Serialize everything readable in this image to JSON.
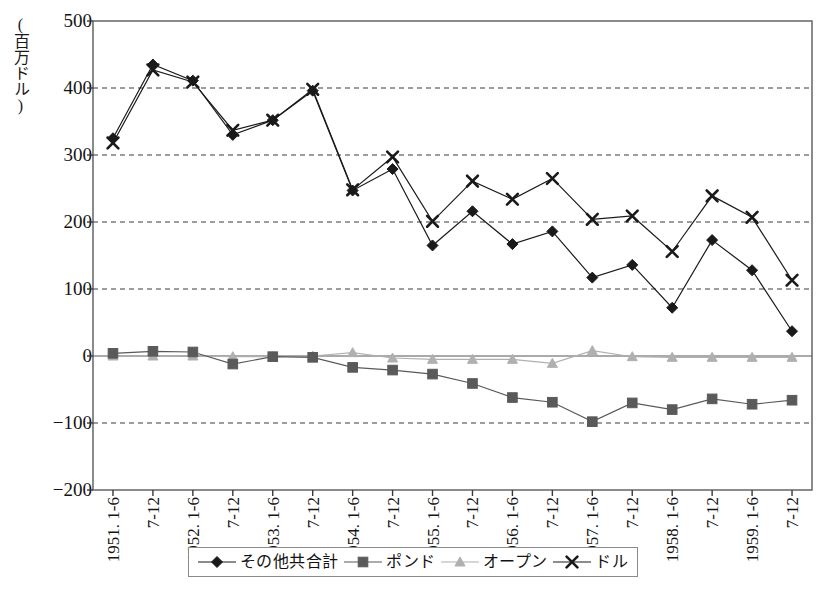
{
  "chart_data": {
    "type": "line",
    "title": "",
    "xlabel": "",
    "ylabel": "(百万ドル)",
    "ylim": [
      -200,
      500
    ],
    "ytick_values": [
      500,
      400,
      300,
      200,
      100,
      0,
      -100,
      -200
    ],
    "ytick_labels": [
      "500",
      "400",
      "300",
      "200",
      "100",
      "0",
      "−100",
      "−200"
    ],
    "grid": "horizontal-dashed",
    "legend_position": "bottom",
    "categories": [
      "1951. 1-6",
      "7-12",
      "1952. 1-6",
      "7-12",
      "1953. 1-6",
      "7-12",
      "1954. 1-6",
      "7-12",
      "1955. 1-6",
      "7-12",
      "1956. 1-6",
      "7-12",
      "1957. 1-6",
      "7-12",
      "1958. 1-6",
      "7-12",
      "1959. 1-6",
      "7-12"
    ],
    "series": [
      {
        "name": "その他共合計",
        "marker": "diamond",
        "color": "#1a1a1a",
        "values": [
          325,
          435,
          411,
          330,
          352,
          396,
          247,
          279,
          165,
          216,
          167,
          186,
          117,
          136,
          72,
          173,
          128,
          37
        ]
      },
      {
        "name": "ポンド",
        "marker": "square",
        "color": "#5a5a5a",
        "values": [
          4,
          7,
          6,
          -12,
          -1,
          -2,
          -17,
          -21,
          -27,
          -41,
          -62,
          -69,
          -98,
          -70,
          -80,
          -64,
          -72,
          -66
        ]
      },
      {
        "name": "オープン",
        "marker": "triangle",
        "color": "#b0b0b0",
        "values": [
          0,
          0,
          0,
          -1,
          -1,
          0,
          5,
          -3,
          -5,
          -5,
          -5,
          -11,
          8,
          -1,
          -2,
          -2,
          -2,
          -2
        ]
      },
      {
        "name": "ドル",
        "marker": "x",
        "color": "#1a1a1a",
        "values": [
          318,
          427,
          409,
          337,
          352,
          398,
          248,
          297,
          201,
          261,
          234,
          265,
          204,
          209,
          156,
          239,
          207,
          113
        ]
      }
    ]
  },
  "legend": {
    "items": [
      {
        "label": "その他共合計",
        "marker": "diamond"
      },
      {
        "label": "ポンド",
        "marker": "square"
      },
      {
        "label": "オープン",
        "marker": "triangle"
      },
      {
        "label": "ドル",
        "marker": "x"
      }
    ]
  }
}
